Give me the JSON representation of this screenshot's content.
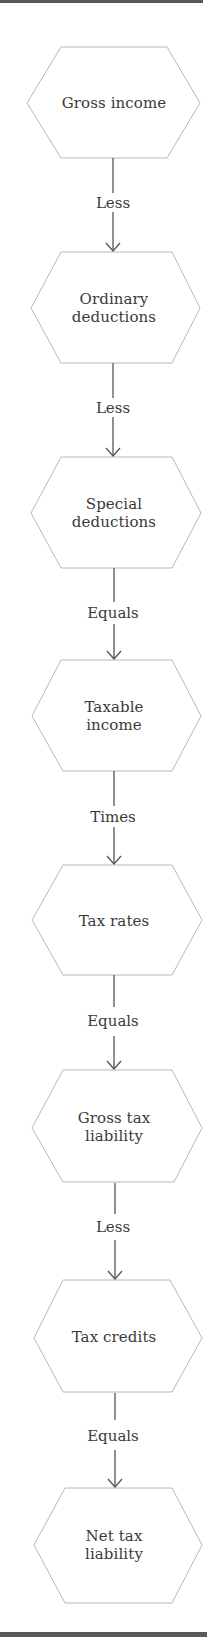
{
  "diagram": {
    "type": "flowchart",
    "direction": "top-to-bottom",
    "colors": {
      "rule": "#5a5a5a",
      "node_border": "#b8b8b8",
      "connector": "#555555",
      "text": "#3a3a3a"
    },
    "nodes": [
      {
        "id": "n1",
        "label": "Gross income"
      },
      {
        "id": "n2",
        "label": "Ordinary\ndeductions"
      },
      {
        "id": "n3",
        "label": "Special\ndeductions"
      },
      {
        "id": "n4",
        "label": "Taxable\nincome"
      },
      {
        "id": "n5",
        "label": "Tax rates"
      },
      {
        "id": "n6",
        "label": "Gross tax\nliability"
      },
      {
        "id": "n7",
        "label": "Tax credits"
      },
      {
        "id": "n8",
        "label": "Net tax\nliability"
      }
    ],
    "edges": [
      {
        "from": "n1",
        "to": "n2",
        "label": "Less"
      },
      {
        "from": "n2",
        "to": "n3",
        "label": "Less"
      },
      {
        "from": "n3",
        "to": "n4",
        "label": "Equals"
      },
      {
        "from": "n4",
        "to": "n5",
        "label": "Times"
      },
      {
        "from": "n5",
        "to": "n6",
        "label": "Equals"
      },
      {
        "from": "n6",
        "to": "n7",
        "label": "Less"
      },
      {
        "from": "n7",
        "to": "n8",
        "label": "Equals"
      }
    ]
  }
}
